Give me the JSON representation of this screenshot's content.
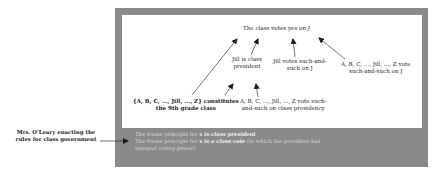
{
  "diagram": {
    "top_node": {
      "text": "The class votes yes on ",
      "italic_suffix": "J"
    },
    "jill_president": {
      "line1": "Jill is class",
      "line2": "president"
    },
    "jill_votes": {
      "line1": "Jill votes such-and-",
      "line2": "such on J"
    },
    "all_vote": {
      "line1": "A, B, C, ..., Jill, ..., Z vote",
      "line2": "such-and-such on J"
    },
    "class_constitutes": {
      "line1": "{A, B, C, ..., Jill, ..., Z} constitutes",
      "line2": "the 9th grade class"
    },
    "presidency_vote": {
      "line1": "A, B, C, ..., Jill, ..., Z vote such-",
      "line2": "and-such on class presidency"
    },
    "footer": {
      "line1_prefix": "The frame principle for ",
      "line1_emph": "x is class president",
      "line2_prefix": "The frame principle for ",
      "line2_emph": "x is a class vote",
      "line2_suffix": " (in which the president has",
      "line3": "unequal voting power)"
    },
    "side_label": {
      "line1": "Mrs. O'Leary enacting the",
      "line2": "rules for class government"
    },
    "colors": {
      "frame": "#8a8a8a",
      "inner": "#ffffff",
      "arrow": "#1a1a1a",
      "footer_text": "#d6d6d6"
    }
  }
}
